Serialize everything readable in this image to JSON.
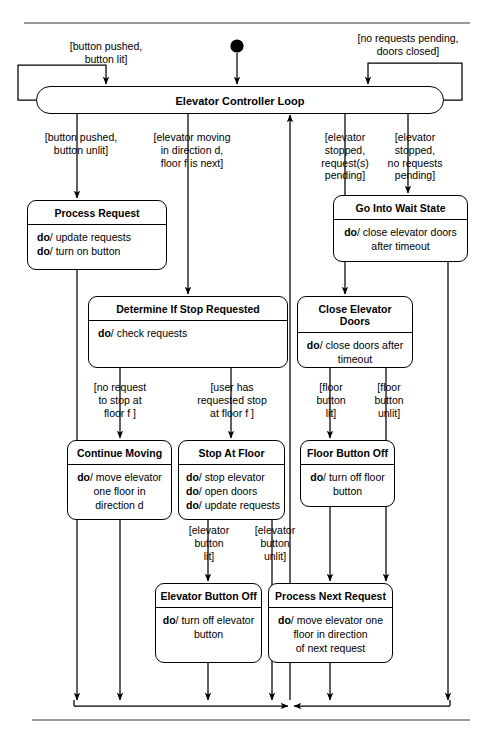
{
  "diagram": {
    "type": "uml-state-diagram",
    "line_color": "#000000",
    "rule_color": "#9a9a9a",
    "background": "#ffffff"
  },
  "initial_state": {
    "name": "initial-pseudostate",
    "shape": "filled-circle"
  },
  "loop_bar": {
    "label": "Elevator Controller Loop"
  },
  "states": [
    {
      "id": "process-request",
      "title": "Process Request",
      "actions": [
        "do/ update requests",
        "do/ turn on button"
      ],
      "align": "left"
    },
    {
      "id": "determine-if-stop-requested",
      "title": "Determine If Stop Requested",
      "actions": [
        "do/ check requests"
      ],
      "align": "left"
    },
    {
      "id": "go-into-wait-state",
      "title": "Go Into Wait State",
      "actions": [
        "do/ close elevator doors",
        "after timeout"
      ],
      "align": "center"
    },
    {
      "id": "close-elevator-doors",
      "title": "Close Elevator Doors",
      "actions": [
        "do/ close doors after",
        "timeout"
      ],
      "align": "center"
    },
    {
      "id": "continue-moving",
      "title": "Continue Moving",
      "actions": [
        "do/ move elevator",
        "one floor in",
        "direction d"
      ],
      "align": "center"
    },
    {
      "id": "stop-at-floor",
      "title": "Stop At Floor",
      "actions": [
        "do/ stop elevator",
        "do/ open doors",
        "do/ update requests"
      ],
      "align": "left"
    },
    {
      "id": "floor-button-off",
      "title": "Floor Button Off",
      "actions": [
        "do/ turn off floor",
        "button"
      ],
      "align": "center"
    },
    {
      "id": "elevator-button-off",
      "title": "Elevator Button Off",
      "actions": [
        "do/ turn off elevator",
        "button"
      ],
      "align": "center"
    },
    {
      "id": "process-next-request",
      "title": "Process Next Request",
      "actions": [
        "do/ move elevator one",
        "floor in direction",
        "of next request"
      ],
      "align": "center"
    }
  ],
  "guards": {
    "button_pushed_lit": "[button pushed,\nbutton lit]",
    "no_requests_pending_doors_closed": "[no requests pending,\ndoors closed]",
    "button_pushed_unlit": "[button pushed,\nbutton unlit]",
    "elevator_moving": "[elevator moving\nin direction d,\nfloor f is next]",
    "elevator_stopped_requests_pending": "[elevator\nstopped,\nrequest(s)\npending]",
    "elevator_stopped_no_requests": "[elevator\nstopped,\nno requests\npending]",
    "no_request_to_stop": "[no request\nto stop at\nfloor f ]",
    "user_requested_stop": "[user has\nrequested stop\nat floor f ]",
    "floor_button_lit": "[floor\nbutton\nlit]",
    "floor_button_unlit": "[floor\nbutton\nunlit]",
    "elevator_button_lit": "[elevator\nbutton\nlit]",
    "elevator_button_unlit": "[elevator\nbutton\nunlit]"
  }
}
